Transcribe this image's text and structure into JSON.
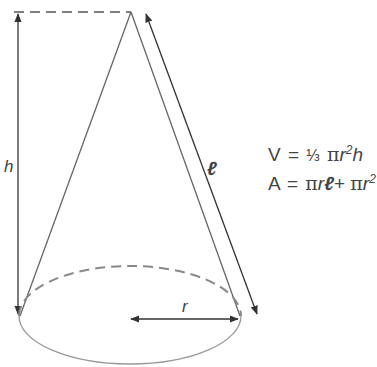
{
  "diagram": {
    "labels": {
      "height": "h",
      "slant": "ℓ",
      "radius": "r"
    },
    "formulas": {
      "volume": {
        "lhs": "V",
        "eq": "=",
        "frac": "⅓",
        "pi": "π",
        "r": "r",
        "exp": "2",
        "h": "h"
      },
      "area": {
        "lhs": "A",
        "eq": "=",
        "pi1": "π",
        "r1": "r",
        "l": "ℓ",
        "plus": "+",
        "pi2": "π",
        "r2": "r",
        "exp": "2"
      }
    },
    "colors": {
      "line": "#555555",
      "arrow": "#333333",
      "base": "#888888",
      "text": "#444444"
    }
  }
}
